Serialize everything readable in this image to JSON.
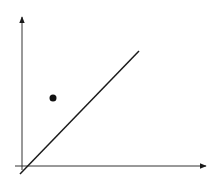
{
  "diagram": {
    "type": "coordinate-plot",
    "background": "#ffffff",
    "stroke_color": "#1a1a1a",
    "axis_color": "#333333",
    "y_axis": {
      "x1": 22,
      "y1": 170,
      "x2": 22,
      "y2": 17
    },
    "x_axis": {
      "x1": 15,
      "y1": 166,
      "x2": 206,
      "y2": 166
    },
    "line": {
      "x1": 20,
      "y1": 174,
      "x2": 139,
      "y2": 51
    },
    "point": {
      "cx": 53,
      "cy": 98,
      "r": 3.5
    }
  }
}
